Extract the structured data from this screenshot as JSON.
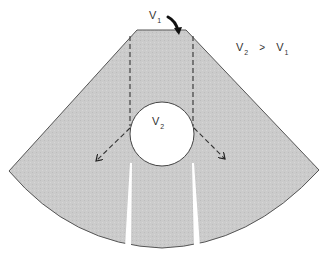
{
  "diagram": {
    "colors": {
      "sector_fill": "#c9c9c9",
      "sector_stroke": "#555555",
      "dashed_line": "#333333",
      "arrow": "#111111",
      "circle_fill": "#ffffff",
      "background": "#ffffff"
    },
    "labels": {
      "v1_top": {
        "main": "V",
        "sub": "1"
      },
      "v2_circle": {
        "main": "V",
        "sub": "2"
      },
      "relation": {
        "left": {
          "main": "V",
          "sub": "2"
        },
        "operator": ">",
        "right": {
          "main": "V",
          "sub": "1"
        }
      }
    },
    "elements": [
      "sector-shaped ultrasound field",
      "circular structure with velocity V2",
      "two vertical dashed beam edges",
      "two dashed refracted arrows diverging outward",
      "curved arrow indicating V1 incident beam",
      "two white refraction shadow bands below the circle"
    ]
  }
}
